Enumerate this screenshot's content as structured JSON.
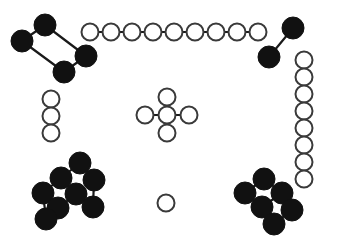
{
  "canvas": {
    "width": 337,
    "height": 246,
    "background": "#ffffff",
    "title": "Node Graph Diagram"
  },
  "style": {
    "filled_fill": "#111111",
    "filled_stroke": "#111111",
    "open_fill": "#ffffff",
    "open_stroke": "#3a3a3a",
    "edge_color": "#1a1a1a",
    "open_node_radius": 8.5,
    "open_node_stroke_width": 2,
    "filled_node_radius": 10.5,
    "edge_width_filled": 2.2,
    "edge_width_open": 2
  },
  "legend": {
    "filled_label": "filled node",
    "open_label": "open node"
  },
  "graphs": [
    {
      "id": "top-left-ring",
      "name": "top-left-filled-ring",
      "node_style": "filled",
      "edge_width": 2.2,
      "node_radius": 11,
      "nodes": [
        {
          "id": "a",
          "x": 45,
          "y": 25
        },
        {
          "id": "b",
          "x": 22,
          "y": 41
        },
        {
          "id": "c",
          "x": 64,
          "y": 72
        },
        {
          "id": "d",
          "x": 86,
          "y": 56
        }
      ],
      "edges": [
        {
          "from": "a",
          "to": "b"
        },
        {
          "from": "a",
          "to": "d"
        },
        {
          "from": "b",
          "to": "c"
        },
        {
          "from": "c",
          "to": "d"
        }
      ]
    },
    {
      "id": "top-chain",
      "name": "top-open-chain",
      "node_style": "open",
      "edge_width": 2,
      "node_radius": 8.5,
      "nodes": [
        {
          "id": "n1",
          "x": 90,
          "y": 32
        },
        {
          "id": "n2",
          "x": 111,
          "y": 32
        },
        {
          "id": "n3",
          "x": 132,
          "y": 32
        },
        {
          "id": "n4",
          "x": 153,
          "y": 32
        },
        {
          "id": "n5",
          "x": 174,
          "y": 32
        },
        {
          "id": "n6",
          "x": 195,
          "y": 32
        },
        {
          "id": "n7",
          "x": 216,
          "y": 32
        },
        {
          "id": "n8",
          "x": 237,
          "y": 32
        },
        {
          "id": "n9",
          "x": 258,
          "y": 32
        }
      ],
      "edges": [
        {
          "from": "n1",
          "to": "n2"
        },
        {
          "from": "n2",
          "to": "n3"
        },
        {
          "from": "n3",
          "to": "n4"
        },
        {
          "from": "n4",
          "to": "n5"
        },
        {
          "from": "n5",
          "to": "n6"
        },
        {
          "from": "n6",
          "to": "n7"
        },
        {
          "from": "n7",
          "to": "n8"
        },
        {
          "from": "n8",
          "to": "n9"
        }
      ]
    },
    {
      "id": "top-right-pair",
      "name": "top-right-filled-pair",
      "node_style": "filled",
      "edge_width": 2.2,
      "node_radius": 11,
      "nodes": [
        {
          "id": "p1",
          "x": 293,
          "y": 28
        },
        {
          "id": "p2",
          "x": 269,
          "y": 57
        }
      ],
      "edges": [
        {
          "from": "p1",
          "to": "p2"
        }
      ]
    },
    {
      "id": "right-chain",
      "name": "right-open-vertical-chain",
      "node_style": "open",
      "edge_width": 2,
      "node_radius": 8.5,
      "nodes": [
        {
          "id": "r1",
          "x": 304,
          "y": 60
        },
        {
          "id": "r2",
          "x": 304,
          "y": 77
        },
        {
          "id": "r3",
          "x": 304,
          "y": 94
        },
        {
          "id": "r4",
          "x": 304,
          "y": 111
        },
        {
          "id": "r5",
          "x": 304,
          "y": 128
        },
        {
          "id": "r6",
          "x": 304,
          "y": 145
        },
        {
          "id": "r7",
          "x": 304,
          "y": 162
        },
        {
          "id": "r8",
          "x": 304,
          "y": 179
        }
      ],
      "edges": [
        {
          "from": "r1",
          "to": "r2"
        },
        {
          "from": "r2",
          "to": "r3"
        },
        {
          "from": "r3",
          "to": "r4"
        },
        {
          "from": "r4",
          "to": "r5"
        },
        {
          "from": "r5",
          "to": "r6"
        },
        {
          "from": "r6",
          "to": "r7"
        },
        {
          "from": "r7",
          "to": "r8"
        }
      ]
    },
    {
      "id": "left-chain",
      "name": "left-open-vertical-chain",
      "node_style": "open",
      "edge_width": 2,
      "node_radius": 8.5,
      "nodes": [
        {
          "id": "l1",
          "x": 51,
          "y": 99
        },
        {
          "id": "l2",
          "x": 51,
          "y": 116
        },
        {
          "id": "l3",
          "x": 51,
          "y": 133
        }
      ],
      "edges": [
        {
          "from": "l1",
          "to": "l2"
        },
        {
          "from": "l2",
          "to": "l3"
        }
      ]
    },
    {
      "id": "center-cross",
      "name": "center-open-cross",
      "node_style": "open",
      "edge_width": 2,
      "node_radius": 8.5,
      "nodes": [
        {
          "id": "c0",
          "x": 167,
          "y": 115
        },
        {
          "id": "cu",
          "x": 167,
          "y": 97
        },
        {
          "id": "cd",
          "x": 167,
          "y": 133
        },
        {
          "id": "cl",
          "x": 145,
          "y": 115
        },
        {
          "id": "cr",
          "x": 189,
          "y": 115
        }
      ],
      "edges": [
        {
          "from": "c0",
          "to": "cu"
        },
        {
          "from": "c0",
          "to": "cd"
        },
        {
          "from": "c0",
          "to": "cl"
        },
        {
          "from": "c0",
          "to": "cr"
        }
      ]
    },
    {
      "id": "lone-circle",
      "name": "isolated-open-node",
      "node_style": "open",
      "edge_width": 2,
      "node_radius": 8.5,
      "nodes": [
        {
          "id": "s1",
          "x": 166,
          "y": 203
        }
      ],
      "edges": []
    },
    {
      "id": "bottom-left-fused",
      "name": "bottom-left-filled-fused-rings",
      "node_style": "filled",
      "edge_width": 2.2,
      "node_radius": 11,
      "nodes": [
        {
          "id": "q1",
          "x": 80,
          "y": 163
        },
        {
          "id": "q2",
          "x": 94,
          "y": 180
        },
        {
          "id": "q3",
          "x": 61,
          "y": 178
        },
        {
          "id": "q4",
          "x": 76,
          "y": 194
        },
        {
          "id": "q5",
          "x": 43,
          "y": 193
        },
        {
          "id": "q6",
          "x": 58,
          "y": 208
        },
        {
          "id": "q7",
          "x": 93,
          "y": 207
        },
        {
          "id": "q8",
          "x": 46,
          "y": 219
        }
      ],
      "edges": [
        {
          "from": "q1",
          "to": "q2"
        },
        {
          "from": "q1",
          "to": "q3"
        },
        {
          "from": "q3",
          "to": "q4"
        },
        {
          "from": "q3",
          "to": "q5"
        },
        {
          "from": "q2",
          "to": "q7"
        },
        {
          "from": "q4",
          "to": "q7"
        },
        {
          "from": "q5",
          "to": "q6"
        },
        {
          "from": "q6",
          "to": "q8"
        },
        {
          "from": "q8",
          "to": "q6"
        },
        {
          "from": "q5",
          "to": "q8"
        },
        {
          "from": "q6",
          "to": "q4"
        }
      ]
    },
    {
      "id": "bottom-right-fused",
      "name": "bottom-right-filled-fused-rings",
      "node_style": "filled",
      "edge_width": 2.2,
      "node_radius": 11,
      "nodes": [
        {
          "id": "w1",
          "x": 264,
          "y": 179
        },
        {
          "id": "w2",
          "x": 245,
          "y": 193
        },
        {
          "id": "w3",
          "x": 282,
          "y": 193
        },
        {
          "id": "w4",
          "x": 262,
          "y": 207
        },
        {
          "id": "w5",
          "x": 292,
          "y": 210
        },
        {
          "id": "w6",
          "x": 274,
          "y": 224
        }
      ],
      "edges": [
        {
          "from": "w1",
          "to": "w2"
        },
        {
          "from": "w1",
          "to": "w3"
        },
        {
          "from": "w2",
          "to": "w4"
        },
        {
          "from": "w3",
          "to": "w4"
        },
        {
          "from": "w3",
          "to": "w5"
        },
        {
          "from": "w4",
          "to": "w6"
        },
        {
          "from": "w5",
          "to": "w6"
        }
      ]
    }
  ]
}
